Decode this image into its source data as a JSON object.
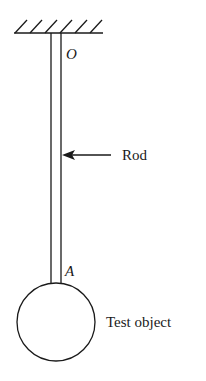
{
  "diagram": {
    "title": "",
    "labels": {
      "pivot": "O",
      "rod": "Rod",
      "attachment": "A",
      "object": "Test object"
    },
    "colors": {
      "stroke": "#1a1a1a",
      "background": "#ffffff"
    },
    "elements": [
      {
        "id": "ceiling",
        "type": "hatched-support"
      },
      {
        "id": "rod",
        "type": "double-line-rod",
        "from": "O",
        "to": "A"
      },
      {
        "id": "rod-arrow",
        "type": "arrow",
        "points_to": "rod",
        "label": "Rod"
      },
      {
        "id": "test-object",
        "type": "circle",
        "label": "Test object"
      }
    ]
  }
}
